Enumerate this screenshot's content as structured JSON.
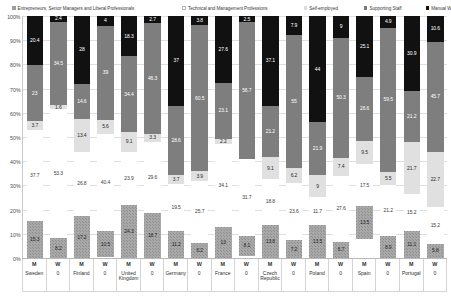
{
  "legend": {
    "items": [
      {
        "label": "Entrepreneurs, Senior Managers and Liberal Professionals",
        "key": "entrepreneurs",
        "color": "#a8a8a8"
      },
      {
        "label": "Technical and Management Professions",
        "key": "technical",
        "color": "#ffffff"
      },
      {
        "label": "Self-employed",
        "key": "self_employed",
        "color": "#e0e0e0"
      },
      {
        "label": "Supporting Staff",
        "key": "supporting",
        "color": "#7e7e7e"
      },
      {
        "label": "Manual Workers",
        "key": "manual",
        "color": "#111111"
      }
    ]
  },
  "yaxis": {
    "ticks": [
      "100%",
      "90%",
      "80%",
      "70%",
      "60%",
      "50%",
      "40%",
      "30%",
      "20%",
      "10%",
      "0%"
    ]
  },
  "chart_data": {
    "type": "bar",
    "title": "",
    "xlabel": "",
    "ylabel": "",
    "ylim": [
      0,
      100
    ],
    "stacked": true,
    "grid": true,
    "legend_position": "top",
    "categories": [
      "Sweden M",
      "Sweden W",
      "Finland M",
      "Finland W",
      "United Kingdom M",
      "United Kingdom W",
      "Germany M",
      "Germany W",
      "France M",
      "France W",
      "Czech Republic M",
      "Czech Republic W",
      "Poland M",
      "Poland W",
      "Spain M",
      "Spain W",
      "Portugal M",
      "Portugal W"
    ],
    "groups": [
      {
        "country": "Sweden",
        "gender": "M"
      },
      {
        "country": "0",
        "gender": "W"
      },
      {
        "country": "Finland",
        "gender": "M"
      },
      {
        "country": "0",
        "gender": "W"
      },
      {
        "country": "United Kingdom",
        "gender": "M"
      },
      {
        "country": "0",
        "gender": "W"
      },
      {
        "country": "Germany",
        "gender": "M"
      },
      {
        "country": "0",
        "gender": "W"
      },
      {
        "country": "France",
        "gender": "M"
      },
      {
        "country": "0",
        "gender": "W"
      },
      {
        "country": "Czech Republic",
        "gender": "M"
      },
      {
        "country": "0",
        "gender": "W"
      },
      {
        "country": "Poland",
        "gender": "M"
      },
      {
        "country": "0",
        "gender": "W"
      },
      {
        "country": "Spain",
        "gender": "M"
      },
      {
        "country": "0",
        "gender": "W"
      },
      {
        "country": "Portugal",
        "gender": "M"
      },
      {
        "country": "0",
        "gender": "W"
      }
    ],
    "series": [
      {
        "name": "Entrepreneurs, Senior Managers and Liberal Professionals",
        "values": [
          15.3,
          8.2,
          17.2,
          10.5,
          24.3,
          18.7,
          11.2,
          6.2,
          13,
          8.1,
          13.8,
          7.2,
          13.5,
          6.7,
          13.5,
          8.9,
          11.1,
          5.8
        ]
      },
      {
        "name": "Technical and Management Professions",
        "values": [
          37.7,
          53.3,
          26.8,
          40.4,
          23.9,
          29.6,
          19.5,
          25.7,
          34.1,
          31.7,
          18.8,
          23.6,
          11.7,
          27.6,
          17.5,
          21.2,
          15.2,
          15.2
        ]
      },
      {
        "name": "Self-employed",
        "values": [
          3.7,
          1.6,
          13.4,
          5.6,
          9.1,
          3.3,
          3.7,
          3.9,
          2.2,
          0,
          9.1,
          6.2,
          9,
          7.4,
          9.5,
          5.5,
          21.7,
          22.7
        ]
      },
      {
        "name": "Supporting Staff",
        "values": [
          23,
          34.5,
          14.6,
          39,
          34.4,
          46.3,
          28.6,
          60.5,
          23.1,
          56.7,
          21.2,
          55,
          21.9,
          50.3,
          26.6,
          59.5,
          21.2,
          45.7
        ]
      },
      {
        "name": "Manual Workers",
        "values": [
          20.4,
          2.4,
          28,
          4,
          18.3,
          2.7,
          37,
          3.8,
          27.6,
          2.5,
          37.1,
          7.9,
          44,
          9,
          25.1,
          4.9,
          30.9,
          10.6
        ]
      }
    ]
  }
}
